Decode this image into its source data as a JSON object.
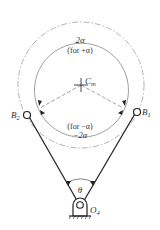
{
  "diagram": {
    "center_label": "C",
    "center_label_sub": "m",
    "top_arc_label": "2α",
    "top_arc_note": "(for +α)",
    "bottom_arc_note": "(for −α)",
    "bottom_arc_label": "−2α",
    "left_point_label": "B",
    "left_point_sub": "2",
    "right_point_label": "B",
    "right_point_sub": "1",
    "pivot_label": "O",
    "pivot_sub": "4",
    "angle_label": "θ"
  },
  "colors": {
    "line": "#2a2a2a",
    "arc": "#777777",
    "dashed": "#999999",
    "background": "#ffffff"
  }
}
